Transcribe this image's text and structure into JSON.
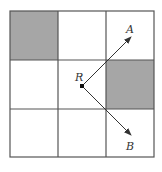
{
  "diagram": {
    "grid": {
      "rows": 3,
      "cols": 3,
      "origin": [
        10,
        11
      ],
      "cell_size": 48,
      "line_color": "#555555",
      "shade_color": "#a6a6a6",
      "shaded_cells": [
        {
          "row": 0,
          "col": 0
        },
        {
          "row": 1,
          "col": 2
        }
      ]
    },
    "point_R": {
      "label": "R",
      "x": 82,
      "y": 86
    },
    "vectors": [
      {
        "name": "A",
        "label": "A",
        "from": [
          82,
          86
        ],
        "to": [
          131,
          37
        ],
        "label_pos": [
          129,
          31
        ]
      },
      {
        "name": "B",
        "label": "B",
        "from": [
          82,
          86
        ],
        "to": [
          131,
          135
        ],
        "label_pos": [
          129,
          147
        ]
      }
    ]
  }
}
